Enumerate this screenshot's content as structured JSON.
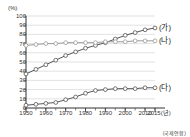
{
  "chart_data": {
    "type": "line",
    "title": "",
    "xlabel": "",
    "ylabel": "",
    "unit_label": "(%)",
    "x_axis_unit": "2015(년)",
    "source": "(국제연합)",
    "ylim": [
      0,
      100
    ],
    "xlim": [
      1950,
      2015
    ],
    "grid": true,
    "legend_position": "right-inline",
    "y_ticks": [
      "100",
      "90",
      "80",
      "70",
      "60",
      "50",
      "40",
      "30",
      "20",
      "10",
      "0"
    ],
    "y_tick_values": [
      100,
      90,
      80,
      70,
      60,
      50,
      40,
      30,
      20,
      10,
      0
    ],
    "x_ticks": [
      "1950",
      "1960",
      "1970",
      "1980",
      "1990",
      "2000",
      "2010",
      "2015(년)"
    ],
    "x_tick_values": [
      1950,
      1960,
      1970,
      1980,
      1990,
      2000,
      2010,
      2015
    ],
    "x": [
      1950,
      1955,
      1960,
      1965,
      1970,
      1975,
      1980,
      1985,
      1990,
      1995,
      2000,
      2005,
      2010,
      2015
    ],
    "series": [
      {
        "name": "(가)",
        "label": "(가)",
        "color": "#555555",
        "marker": "open-circle",
        "values": [
          37,
          42,
          47,
          52,
          57,
          61,
          65,
          68,
          71,
          75,
          79,
          82,
          85,
          87
        ]
      },
      {
        "name": "(나)",
        "label": "(나)",
        "color": "#9a9a9a",
        "marker": "open-circle",
        "values": [
          68,
          69,
          70,
          70,
          71,
          71,
          71,
          71,
          72,
          72,
          72,
          73,
          73,
          73
        ]
      },
      {
        "name": "(다)",
        "label": "(다)",
        "color": "#555555",
        "marker": "open-circle",
        "values": [
          3,
          4,
          5,
          6,
          9,
          12,
          16,
          19,
          20,
          21,
          21,
          21,
          22,
          22
        ]
      }
    ]
  },
  "colors": {
    "axis": "#333333",
    "grid": "#cfcfcf",
    "plot_background": "#ffffff",
    "series_dark": "#555555",
    "series_light": "#9a9a9a"
  }
}
